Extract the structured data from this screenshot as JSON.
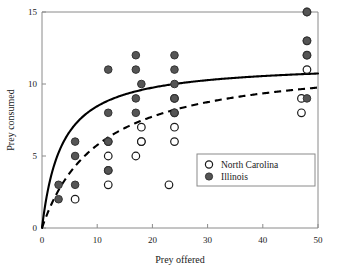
{
  "chart_data": {
    "type": "scatter",
    "title": "",
    "xlabel": "Prey offered",
    "ylabel": "Prey consumed",
    "xlim": [
      0,
      50
    ],
    "ylim": [
      0,
      15
    ],
    "xticks": [
      0,
      10,
      20,
      30,
      40,
      50
    ],
    "yticks": [
      0,
      5,
      10,
      15
    ],
    "grid": false,
    "legend_position": "lower-right",
    "legend": [
      {
        "label": "North Carolina",
        "marker": "open-circle",
        "fill": "#ffffff",
        "stroke": "#1a1a1a"
      },
      {
        "label": "Illinois",
        "marker": "filled-circle",
        "fill": "#555555",
        "stroke": "#333333"
      }
    ],
    "series": [
      {
        "name": "North Carolina",
        "marker": "open-circle",
        "points": [
          [
            6,
            2
          ],
          [
            12,
            3
          ],
          [
            12,
            4
          ],
          [
            12,
            5
          ],
          [
            12,
            6
          ],
          [
            17,
            5
          ],
          [
            18,
            6
          ],
          [
            18,
            6
          ],
          [
            18,
            7
          ],
          [
            23,
            3
          ],
          [
            24,
            6
          ],
          [
            24,
            7
          ],
          [
            24,
            8
          ],
          [
            24,
            9
          ],
          [
            47,
            8
          ],
          [
            47,
            9
          ],
          [
            48,
            11
          ],
          [
            48,
            12
          ],
          [
            48,
            13
          ],
          [
            48,
            15
          ]
        ]
      },
      {
        "name": "Illinois",
        "marker": "filled-circle",
        "points": [
          [
            3,
            2
          ],
          [
            3,
            3
          ],
          [
            6,
            3
          ],
          [
            6,
            5
          ],
          [
            6,
            6
          ],
          [
            12,
            4
          ],
          [
            12,
            6
          ],
          [
            12,
            8
          ],
          [
            12,
            11
          ],
          [
            17,
            8
          ],
          [
            17,
            9
          ],
          [
            17,
            11
          ],
          [
            17,
            12
          ],
          [
            18,
            10
          ],
          [
            24,
            8
          ],
          [
            24,
            9
          ],
          [
            24,
            10
          ],
          [
            24,
            11
          ],
          [
            24,
            12
          ],
          [
            48,
            9
          ],
          [
            48,
            12
          ],
          [
            48,
            13
          ],
          [
            48,
            15
          ]
        ]
      }
    ],
    "fitted_curves": [
      {
        "name": "Illinois fit",
        "style": "solid",
        "model": "type-II functional response",
        "asymptote": 11.5,
        "half_saturation": 3.6,
        "value_at_50": 11.3
      },
      {
        "name": "North Carolina fit",
        "style": "dashed",
        "model": "type-II functional response",
        "asymptote": 11.8,
        "half_saturation": 10.5,
        "value_at_50": 9.8
      }
    ]
  }
}
